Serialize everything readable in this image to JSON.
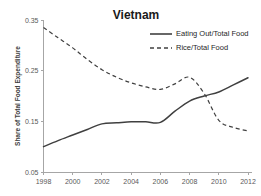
{
  "chart_data": {
    "type": "line",
    "title": "Vietnam",
    "xlabel": "",
    "ylabel": "Share of Total Food Expenditure",
    "x": [
      1998,
      1999,
      2000,
      2001,
      2002,
      2003,
      2004,
      2005,
      2006,
      2007,
      2008,
      2009,
      2010,
      2011,
      2012
    ],
    "xlim": [
      1998,
      2012
    ],
    "ylim": [
      0.05,
      0.35
    ],
    "xticks": [
      1998,
      2000,
      2002,
      2004,
      2006,
      2008,
      2010,
      2012
    ],
    "xtick_labels": [
      "1998",
      "2000",
      "2002",
      "2004",
      "2006",
      "2008",
      "2010",
      "2012"
    ],
    "yticks": [
      0.05,
      0.15,
      0.25,
      0.35
    ],
    "ytick_labels": [
      "0.05",
      "0.15",
      "0.25",
      "0.35"
    ],
    "grid": false,
    "legend_position": "top-right",
    "series": [
      {
        "name": "Eating Out/Total Food",
        "style": "solid",
        "color": "#404040",
        "values": [
          0.1,
          0.112,
          0.123,
          0.134,
          0.145,
          0.147,
          0.149,
          0.149,
          0.148,
          0.17,
          0.19,
          0.2,
          0.208,
          0.222,
          0.236
        ]
      },
      {
        "name": "Rice/Total Food",
        "style": "dashed",
        "color": "#404040",
        "values": [
          0.335,
          0.315,
          0.295,
          0.272,
          0.252,
          0.237,
          0.226,
          0.218,
          0.213,
          0.224,
          0.237,
          0.205,
          0.152,
          0.138,
          0.131
        ]
      }
    ]
  },
  "legend": {
    "items": [
      {
        "label": "Eating Out/Total Food",
        "style": "solid"
      },
      {
        "label": "Rice/Total Food",
        "style": "dashed"
      }
    ]
  },
  "colors": {
    "axis": "#a6a6a6",
    "tick_text": "#595959",
    "line": "#404040",
    "title_text": "#1a1a1a",
    "background": "#ffffff"
  }
}
